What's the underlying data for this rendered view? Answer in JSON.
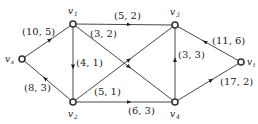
{
  "diagram": {
    "type": "directed-network",
    "colors": {
      "edge": "#333333",
      "node_fill": "#ffffff",
      "node_stroke": "#333333",
      "text": "#222222"
    },
    "nodes": [
      {
        "id": "vs",
        "label": "v",
        "sub": "s",
        "x": 22,
        "y": 59,
        "lx": 5,
        "ly": 62,
        "sx": 11,
        "sy": 64
      },
      {
        "id": "v1",
        "label": "v",
        "sub": "1",
        "x": 73,
        "y": 24,
        "lx": 68,
        "ly": 14,
        "sx": 74,
        "sy": 16
      },
      {
        "id": "v2",
        "label": "v",
        "sub": "2",
        "x": 73,
        "y": 102,
        "lx": 68,
        "ly": 117,
        "sx": 74,
        "sy": 119
      },
      {
        "id": "v3",
        "label": "v",
        "sub": "3",
        "x": 175,
        "y": 25,
        "lx": 170,
        "ly": 15,
        "sx": 176,
        "sy": 17
      },
      {
        "id": "v4",
        "label": "v",
        "sub": "4",
        "x": 175,
        "y": 102,
        "lx": 170,
        "ly": 117,
        "sx": 176,
        "sy": 119
      },
      {
        "id": "vt",
        "label": "v",
        "sub": "t",
        "x": 241,
        "y": 62,
        "lx": 247,
        "ly": 65,
        "sx": 253,
        "sy": 67
      }
    ],
    "edges": [
      {
        "from": "vs",
        "to": "v1",
        "label": "(10, 5)",
        "lx": 22,
        "ly": 35
      },
      {
        "from": "v2",
        "to": "vs",
        "label": "(8, 3)",
        "lx": 24,
        "ly": 91
      },
      {
        "from": "v1",
        "to": "v2",
        "label": "(4, 1)",
        "lx": 76,
        "ly": 66
      },
      {
        "from": "v1",
        "to": "v3",
        "label": "(5, 2)",
        "lx": 114,
        "ly": 19
      },
      {
        "from": "v1",
        "to": "v4",
        "label": "(3, 2)",
        "lx": 90,
        "ly": 37
      },
      {
        "from": "v2",
        "to": "v3",
        "label": "(5, 1)",
        "lx": 94,
        "ly": 95
      },
      {
        "from": "v2",
        "to": "v4",
        "label": "(6, 3)",
        "lx": 128,
        "ly": 114
      },
      {
        "from": "v4",
        "to": "v3",
        "label": "(3, 3)",
        "lx": 178,
        "ly": 58
      },
      {
        "from": "vt",
        "to": "v3",
        "label": "(11, 6)",
        "lx": 212,
        "ly": 44
      },
      {
        "from": "v4",
        "to": "vt",
        "label": "(17, 2)",
        "lx": 220,
        "ly": 85
      }
    ]
  }
}
